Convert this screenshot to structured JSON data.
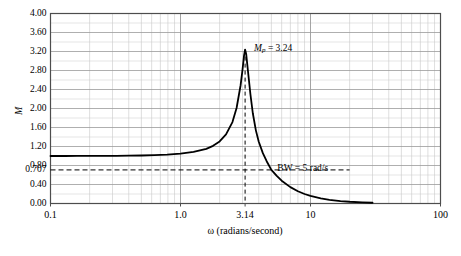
{
  "chart_data": {
    "type": "line",
    "title": "",
    "xlabel": "ω (radians/second)",
    "ylabel": "M",
    "xscale": "log",
    "yscale": "linear",
    "xlim": [
      0.1,
      100
    ],
    "ylim": [
      0.0,
      4.0
    ],
    "grid": true,
    "legend": "none",
    "x_ticks": [
      {
        "value": 0.1,
        "label": "0.1"
      },
      {
        "value": 1.0,
        "label": "1.0"
      },
      {
        "value": 3.14,
        "label": "3.14"
      },
      {
        "value": 10,
        "label": "10"
      },
      {
        "value": 100,
        "label": "100"
      }
    ],
    "y_ticks": [
      {
        "value": 4.0,
        "label": "4.00"
      },
      {
        "value": 3.6,
        "label": "3.60"
      },
      {
        "value": 3.2,
        "label": "3.20"
      },
      {
        "value": 2.8,
        "label": "2.80"
      },
      {
        "value": 2.4,
        "label": "2.40"
      },
      {
        "value": 2.0,
        "label": "2.00"
      },
      {
        "value": 1.6,
        "label": "1.60"
      },
      {
        "value": 1.2,
        "label": "1.20"
      },
      {
        "value": 0.8,
        "label": "0.80"
      },
      {
        "value": 0.707,
        "label": "0.707"
      },
      {
        "value": 0.4,
        "label": "0.40"
      },
      {
        "value": 0.0,
        "label": "0.00"
      }
    ],
    "series": [
      {
        "name": "M",
        "color": "#000000",
        "points": [
          [
            0.1,
            1.0
          ],
          [
            0.13,
            1.0
          ],
          [
            0.16,
            1.001
          ],
          [
            0.2,
            1.001
          ],
          [
            0.25,
            1.002
          ],
          [
            0.32,
            1.004
          ],
          [
            0.4,
            1.007
          ],
          [
            0.5,
            1.011
          ],
          [
            0.63,
            1.018
          ],
          [
            0.79,
            1.03
          ],
          [
            1.0,
            1.05
          ],
          [
            1.26,
            1.086
          ],
          [
            1.58,
            1.151
          ],
          [
            1.78,
            1.214
          ],
          [
            2.0,
            1.306
          ],
          [
            2.24,
            1.455
          ],
          [
            2.51,
            1.714
          ],
          [
            2.7,
            2.01
          ],
          [
            2.9,
            2.49
          ],
          [
            3.0,
            2.82
          ],
          [
            3.08,
            3.11
          ],
          [
            3.14,
            3.24
          ],
          [
            3.2,
            3.15
          ],
          [
            3.3,
            2.8
          ],
          [
            3.45,
            2.3
          ],
          [
            3.6,
            1.9
          ],
          [
            3.8,
            1.54
          ],
          [
            4.0,
            1.3
          ],
          [
            4.3,
            1.06
          ],
          [
            4.6,
            0.89
          ],
          [
            5.0,
            0.707
          ],
          [
            5.5,
            0.58
          ],
          [
            6.0,
            0.48
          ],
          [
            7.0,
            0.345
          ],
          [
            8.0,
            0.258
          ],
          [
            9.0,
            0.2
          ],
          [
            10.0,
            0.16
          ],
          [
            12.0,
            0.108
          ],
          [
            14.0,
            0.078
          ],
          [
            17.0,
            0.052
          ],
          [
            20.0,
            0.037
          ],
          [
            25.0,
            0.023
          ],
          [
            30.0,
            0.016
          ]
        ]
      }
    ],
    "annotations": [
      {
        "name": "peak-marker",
        "text_prefix": "M",
        "text_sub": "p",
        "text_suffix": " = 3.24",
        "x": 3.14,
        "y": 3.24
      },
      {
        "name": "bandwidth-marker",
        "text": "BW = 5 rad/s",
        "x": 5,
        "y": 0.707
      }
    ],
    "reference_lines": [
      {
        "name": "peak-vertical-dashed",
        "orientation": "vertical",
        "value": 3.14,
        "style": "dashed"
      },
      {
        "name": "bandwidth-horizontal-dashed",
        "orientation": "horizontal",
        "value": 0.707,
        "style": "dashed"
      }
    ],
    "colors": {
      "curve": "#000000",
      "major_grid": "#9a9a9a",
      "minor_grid": "#c8c8c8",
      "axis": "#4d4d4d",
      "dashed": "#000000"
    }
  }
}
